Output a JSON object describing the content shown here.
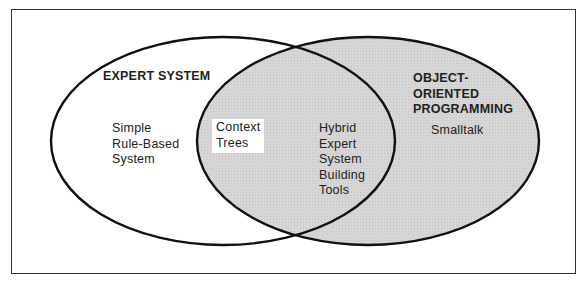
{
  "diagram": {
    "type": "venn",
    "colors": {
      "outline": "#111111",
      "right_fill": "#d4d4d4",
      "left_fill": "#ffffff",
      "background": "#ffffff"
    },
    "left_set": {
      "title": "EXPERT SYSTEM",
      "items": [
        "Simple",
        "Rule-Based",
        "System"
      ]
    },
    "intersection": {
      "highlighted_items": [
        "Context",
        "Trees"
      ],
      "items": [
        "Hybrid",
        "Expert",
        "System",
        "Building",
        "Tools"
      ]
    },
    "right_set": {
      "title_lines": [
        "OBJECT-",
        "ORIENTED",
        "PROGRAMMING"
      ],
      "items": [
        "Smalltalk"
      ]
    }
  }
}
